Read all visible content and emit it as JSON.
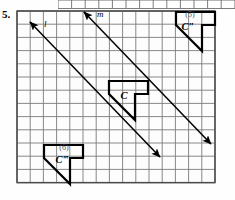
{
  "problem": {
    "number": "5."
  },
  "figure": {
    "type": "coordinate-grid-transformation",
    "grid": {
      "left": 17,
      "top": 11,
      "cell": 13.2,
      "cols": 15,
      "rows": 13,
      "line_color": "#7a7a7a",
      "border_color": "#4a4a4a"
    },
    "lines": [
      {
        "name": "l",
        "label": "l",
        "label_x": 44,
        "label_y": 27,
        "x1": 30,
        "y1": 22,
        "x2": 160,
        "y2": 157,
        "arrow_start": true,
        "arrow_end": true,
        "color": "#000000"
      },
      {
        "name": "m",
        "label": "m",
        "label_x": 97,
        "label_y": 17,
        "x1": 84,
        "y1": 12,
        "x2": 211,
        "y2": 144,
        "arrow_start": true,
        "arrow_end": true,
        "color": "#000000"
      }
    ],
    "shapes": [
      {
        "name": "shape-c",
        "label": "C",
        "tag": "",
        "label_x": 124,
        "label_y": 99,
        "points": "109,81 148,81 148,94 135,94 135,120 109,94",
        "color": "#000000"
      },
      {
        "name": "shape-c-double-prime",
        "label": "C″",
        "tag": "(5)",
        "tag_x": 190,
        "tag_y": 17,
        "label_x": 188,
        "label_y": 30,
        "points": "176,12 215,12 215,25 202,25 202,51 176,25",
        "color": "#000000"
      },
      {
        "name": "shape-c-triple-prime",
        "label": "C‴",
        "tag": "(6)",
        "tag_x": 64,
        "tag_y": 150,
        "label_x": 62,
        "label_y": 163,
        "points": "44,145 83,145 83,158 70,158 70,184 44,158",
        "color": "#000000"
      }
    ]
  }
}
